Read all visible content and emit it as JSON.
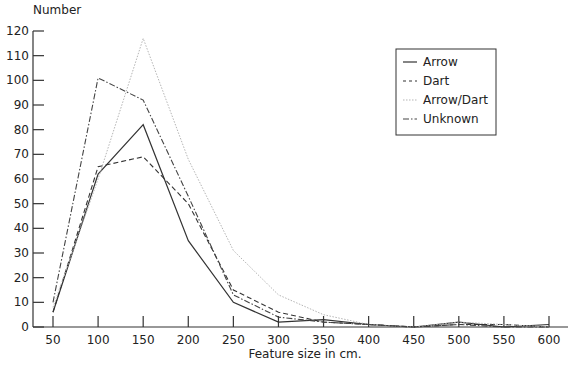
{
  "chart_data": {
    "type": "line",
    "title": "",
    "xlabel": "Feature size in cm.",
    "ylabel": "Number",
    "x": [
      50,
      100,
      150,
      200,
      250,
      300,
      350,
      400,
      450,
      500,
      550,
      600
    ],
    "xticks": [
      "50",
      "100",
      "150",
      "200",
      "250",
      "300",
      "350",
      "400",
      "450",
      "500",
      "550",
      "600"
    ],
    "yticks": [
      "0",
      "10",
      "20",
      "30",
      "40",
      "50",
      "60",
      "70",
      "80",
      "90",
      "100",
      "110",
      "120"
    ],
    "ylim": [
      0,
      120
    ],
    "xlim": [
      25,
      612
    ],
    "grid": false,
    "legend_position": "upper right",
    "series": [
      {
        "name": "Arrow",
        "style": "solid",
        "color": "#333333",
        "values": [
          6,
          62,
          82,
          35,
          10,
          2,
          3,
          1,
          0,
          2,
          0,
          1
        ]
      },
      {
        "name": "Dart",
        "style": "dashed",
        "color": "#333333",
        "values": [
          6,
          65,
          69,
          50,
          15,
          6,
          2,
          1,
          0,
          1,
          1,
          0
        ]
      },
      {
        "name": "Arrow/Dart",
        "style": "dotted",
        "color": "#b5b5b5",
        "values": [
          8,
          60,
          117,
          68,
          31,
          13,
          5,
          1,
          0,
          2,
          1,
          0
        ]
      },
      {
        "name": "Unknown",
        "style": "dashdot",
        "color": "#444444",
        "values": [
          10,
          101,
          92,
          53,
          13,
          4,
          2,
          1,
          0,
          1,
          0,
          0
        ]
      }
    ]
  }
}
